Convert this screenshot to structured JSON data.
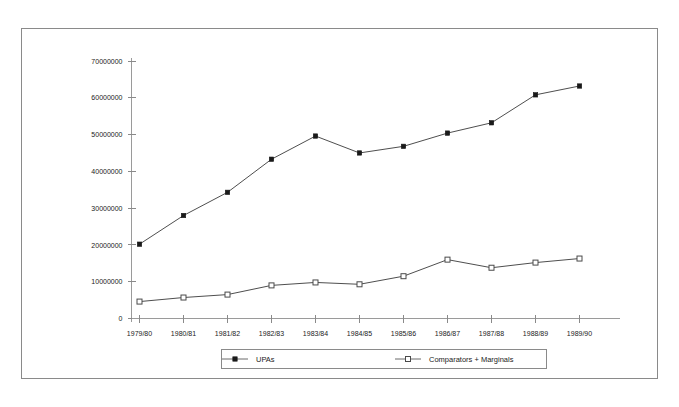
{
  "chart_data": {
    "type": "line",
    "title": "",
    "xlabel": "",
    "ylabel": "",
    "categories": [
      "1979/80",
      "1980/81",
      "1981/82",
      "1982/83",
      "1983/84",
      "1984/85",
      "1985/86",
      "1986/87",
      "1987/88",
      "1988/89",
      "1989/90"
    ],
    "series": [
      {
        "name": "UPAs",
        "marker": "filled-square",
        "values": [
          20200000,
          28000000,
          34300000,
          43300000,
          49600000,
          45000000,
          46800000,
          50400000,
          53200000,
          60800000,
          63200000
        ]
      },
      {
        "name": "Comparators + Marginals",
        "marker": "hollow-square",
        "values": [
          4600000,
          5700000,
          6500000,
          9000000,
          9800000,
          9300000,
          11500000,
          16000000,
          13800000,
          15200000,
          16300000
        ]
      }
    ],
    "ylim": [
      0,
      70000000
    ],
    "ytick_values": [
      0,
      10000000,
      20000000,
      30000000,
      40000000,
      50000000,
      60000000,
      70000000
    ],
    "ytick_labels": [
      "0",
      "10000000",
      "20000000",
      "30000000",
      "40000000",
      "50000000",
      "60000000",
      "70000000"
    ],
    "grid": false,
    "legend_position": "bottom",
    "colors": {
      "series_line": "#3a3a3a",
      "axis": "#9a9a9a",
      "frame_border": "#8a8a8a",
      "text": "#222222",
      "background": "#ffffff"
    }
  },
  "legend": {
    "entries": [
      {
        "label": "UPAs"
      },
      {
        "label": "Comparators + Marginals"
      }
    ]
  }
}
